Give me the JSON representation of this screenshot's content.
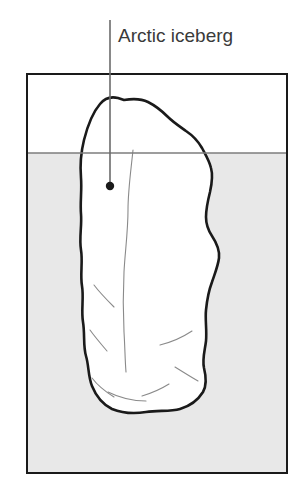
{
  "figure": {
    "background_color": "#ffffff"
  },
  "annotation": {
    "label": "Arctic iceberg",
    "label_color": "#3a3a3a",
    "label_x": 118,
    "label_y": 37,
    "leader_line": {
      "x": 110,
      "y_top": 20,
      "y_bottom": 186,
      "color": "#6b6b6b",
      "width": 1.6
    },
    "marker_dot": {
      "cx": 110,
      "cy": 186,
      "r": 4.2,
      "color": "#1a1a1a"
    }
  },
  "tank": {
    "name": "water tank frame",
    "x": 27,
    "y": 74,
    "width": 260,
    "height": 399,
    "border_color": "#1a1a1a",
    "border_width": 2,
    "fill_color": "#ffffff"
  },
  "water": {
    "name": "water body",
    "surface_y": 153,
    "fill_color": "#e8e8e8",
    "surface_line_color": "#7d7d7d",
    "surface_line_width": 1.4,
    "region_top": 153,
    "region_bottom": 473
  },
  "iceberg": {
    "name": "iceberg body",
    "fill_color": "#ffffff",
    "outline_color": "#1a1a1a",
    "outline_width": 2.6,
    "crack_color": "#8a8a8a",
    "crack_width": 1.1,
    "bounds": {
      "left": 78,
      "right": 220,
      "top": 97,
      "bottom": 414
    },
    "outline_path": "M 118 98 C 110 96 104 99 100 104 C 94 111 88 124 84 140 C 81 152 80 166 81 178 C 82 190 80 202 81 214 C 82 226 79 238 81 250 C 83 262 80 274 82 286 C 84 298 81 310 83 322 C 85 334 83 346 86 356 C 89 366 88 376 92 386 C 96 396 102 404 112 409 C 122 413 134 414 146 412 C 158 410 170 412 180 409 C 190 406 198 400 203 392 C 207 385 206 376 204 368 C 202 359 205 350 206 341 C 207 330 205 320 206 310 C 207 300 209 290 212 282 C 215 273 218 266 219 258 C 220 249 216 242 212 236 C 208 230 206 224 206 217 C 206 208 208 200 210 192 C 212 183 213 175 211 168 C 209 160 205 154 202 148 C 198 141 192 135 186 131 C 179 126 173 122 168 117 C 162 111 156 106 148 102 C 140 98 130 99 124 100 Z",
    "cracks": [
      "M 133 150 C 131 170 128 190 128 210 C 128 232 125 252 124 272 C 123 292 123 312 124 332 C 125 348 125 360 126 372",
      "M 94 285 C 100 293 107 300 114 307",
      "M 90 330 C 95 337 101 344 107 351",
      "M 92 378 C 98 386 106 392 114 397",
      "M 108 392 C 120 398 133 401 146 401",
      "M 160 345 C 172 342 183 337 192 331",
      "M 175 367 C 183 372 191 377 198 381",
      "M 142 396 C 152 393 161 389 169 384"
    ]
  },
  "colors": {
    "ink": "#1a1a1a",
    "water_fill": "#e8e8e8",
    "leader": "#6b6b6b",
    "crack": "#8a8a8a",
    "text": "#3a3a3a"
  }
}
